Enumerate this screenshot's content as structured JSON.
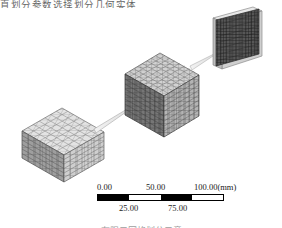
{
  "figure": {
    "caption_top": "直划分参数选择划分几何实体",
    "caption_bottom": "有限元网格划分示意",
    "objects": [
      {
        "name": "coarse-mesh-cube",
        "label": "",
        "mesh": "coarse",
        "shade": "#d9d9d9"
      },
      {
        "name": "fine-mesh-cube",
        "label": "",
        "mesh": "fine",
        "shade": "#8a8a8a"
      },
      {
        "name": "thin-plate",
        "label": "",
        "mesh": "dense",
        "shade": "#4a4a4a"
      }
    ],
    "arrows": [
      {
        "name": "arrow-cube-to-cube"
      },
      {
        "name": "arrow-cube-to-plate"
      }
    ]
  },
  "scalebar": {
    "unit": "(mm)",
    "major_labels": [
      "0.00",
      "50.00",
      "100.00(mm)"
    ],
    "minor_labels": [
      "25.00",
      "75.00"
    ],
    "segments": [
      "dark",
      "light",
      "dark",
      "light"
    ],
    "range_min": 0,
    "range_max": 100,
    "colors": {
      "dark": "#000000",
      "light": "#ffffff",
      "outline": "#000000"
    }
  }
}
